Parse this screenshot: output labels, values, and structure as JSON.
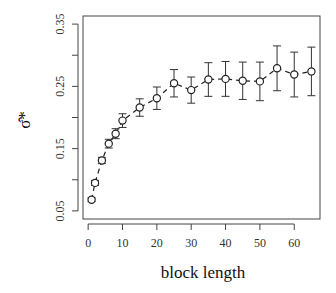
{
  "chart_data": {
    "type": "line",
    "title": "",
    "xlabel": "block length",
    "ylabel": "σ̂*",
    "xlim": [
      -1.5,
      67.5
    ],
    "ylim": [
      0.037,
      0.363
    ],
    "x_ticks": [
      0,
      10,
      20,
      30,
      40,
      50,
      60
    ],
    "y_ticks": [
      0.05,
      0.15,
      0.25,
      0.35
    ],
    "y_minor_ticks": [
      0.1,
      0.2,
      0.3
    ],
    "x_tick_labels": [
      "0",
      "10",
      "20",
      "30",
      "40",
      "50",
      "60"
    ],
    "y_tick_labels": [
      "0.05",
      "0.15",
      "0.25",
      "0.35"
    ],
    "grid": false,
    "legend": null,
    "line_style": "dashed",
    "marker": "open-circle",
    "error_bars": true,
    "series": [
      {
        "name": "sigma-hat-star",
        "x": [
          1,
          2,
          4,
          6,
          8,
          10,
          15,
          20,
          25,
          30,
          35,
          40,
          45,
          50,
          55,
          60,
          65
        ],
        "values": [
          0.068,
          0.095,
          0.131,
          0.158,
          0.174,
          0.195,
          0.216,
          0.231,
          0.255,
          0.244,
          0.261,
          0.262,
          0.259,
          0.258,
          0.279,
          0.269,
          0.274
        ],
        "error": [
          0.003,
          0.004,
          0.005,
          0.007,
          0.008,
          0.011,
          0.014,
          0.018,
          0.022,
          0.021,
          0.027,
          0.028,
          0.03,
          0.031,
          0.036,
          0.036,
          0.039
        ]
      }
    ]
  }
}
